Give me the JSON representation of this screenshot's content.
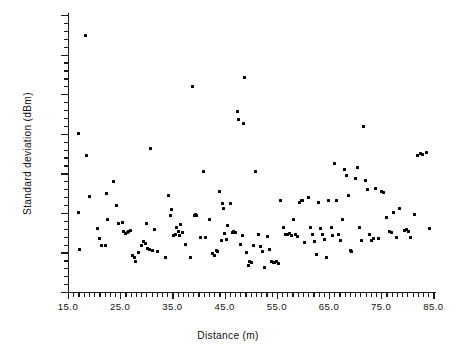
{
  "chart_data": {
    "type": "scatter",
    "title": "",
    "xlabel": "Distance (m)",
    "ylabel": "Standard deviation (dBm)",
    "xlim": [
      15.0,
      85.5
    ],
    "ylim": [
      0.0,
      7.0
    ],
    "grid": false,
    "legend": null,
    "marker": "square",
    "marker_color": "#000000",
    "x_major_ticks": [
      15.0,
      25.0,
      35.0,
      45.0,
      55.0,
      65.0,
      75.0,
      85.0
    ],
    "x_major_tick_labels": [
      "15.0",
      "25.0",
      "35.0",
      "45.0",
      "55.0",
      "65.0",
      "75.0",
      "85.0"
    ],
    "x_minor_tick_interval": 1.0,
    "y_major_ticks": [
      0.0,
      1.0,
      2.0,
      3.0,
      4.0,
      5.0,
      6.0,
      7.0
    ],
    "y_major_tick_labels": [
      "0.0",
      "1.0",
      "2.0",
      "3.0",
      "4.0",
      "5.0",
      "6.0",
      "7.0"
    ],
    "y_minor_tick_interval": 0.2,
    "n_points": 158,
    "points": [
      [
        17.0,
        4.0
      ],
      [
        17.0,
        2.0
      ],
      [
        17.2,
        1.08
      ],
      [
        18.4,
        6.47
      ],
      [
        18.6,
        3.45
      ],
      [
        19.2,
        2.42
      ],
      [
        20.6,
        1.6
      ],
      [
        21.0,
        1.35
      ],
      [
        21.4,
        1.18
      ],
      [
        22.2,
        1.18
      ],
      [
        22.4,
        2.48
      ],
      [
        22.6,
        1.82
      ],
      [
        23.8,
        2.8
      ],
      [
        24.2,
        2.18
      ],
      [
        24.6,
        1.72
      ],
      [
        25.4,
        1.75
      ],
      [
        25.6,
        1.52
      ],
      [
        26.0,
        1.47
      ],
      [
        26.4,
        1.5
      ],
      [
        26.6,
        1.52
      ],
      [
        27.0,
        1.55
      ],
      [
        27.4,
        0.93
      ],
      [
        27.8,
        0.88
      ],
      [
        28.0,
        0.76
      ],
      [
        28.6,
        1.0
      ],
      [
        29.0,
        1.18
      ],
      [
        29.4,
        1.27
      ],
      [
        29.8,
        1.22
      ],
      [
        30.0,
        1.72
      ],
      [
        30.2,
        1.1
      ],
      [
        30.6,
        1.08
      ],
      [
        30.8,
        3.63
      ],
      [
        31.2,
        1.05
      ],
      [
        31.6,
        1.57
      ],
      [
        32.2,
        1.02
      ],
      [
        33.6,
        0.88
      ],
      [
        34.2,
        2.43
      ],
      [
        34.6,
        1.94
      ],
      [
        34.8,
        2.08
      ],
      [
        35.2,
        1.43
      ],
      [
        35.6,
        1.45
      ],
      [
        35.8,
        1.62
      ],
      [
        36.2,
        1.52
      ],
      [
        36.4,
        1.43
      ],
      [
        36.6,
        1.7
      ],
      [
        37.0,
        1.5
      ],
      [
        37.6,
        1.2
      ],
      [
        38.4,
        0.86
      ],
      [
        38.8,
        5.2
      ],
      [
        39.2,
        1.93
      ],
      [
        39.4,
        1.96
      ],
      [
        39.6,
        1.94
      ],
      [
        40.4,
        1.37
      ],
      [
        41.0,
        3.04
      ],
      [
        41.4,
        1.38
      ],
      [
        42.2,
        1.83
      ],
      [
        42.6,
        0.98
      ],
      [
        43.0,
        0.93
      ],
      [
        43.4,
        1.05
      ],
      [
        43.6,
        1.02
      ],
      [
        44.0,
        2.53
      ],
      [
        44.4,
        1.29
      ],
      [
        44.6,
        2.23
      ],
      [
        44.8,
        2.12
      ],
      [
        45.0,
        1.47
      ],
      [
        45.4,
        1.33
      ],
      [
        45.6,
        1.68
      ],
      [
        46.2,
        2.23
      ],
      [
        46.6,
        1.5
      ],
      [
        46.8,
        1.53
      ],
      [
        47.0,
        1.5
      ],
      [
        47.4,
        4.55
      ],
      [
        47.6,
        4.35
      ],
      [
        48.0,
        1.2
      ],
      [
        48.4,
        1.44
      ],
      [
        48.6,
        4.26
      ],
      [
        48.8,
        5.42
      ],
      [
        49.2,
        1.0
      ],
      [
        49.6,
        0.66
      ],
      [
        49.8,
        0.78
      ],
      [
        50.2,
        0.74
      ],
      [
        50.6,
        1.18
      ],
      [
        51.0,
        3.05
      ],
      [
        51.4,
        1.46
      ],
      [
        51.8,
        1.16
      ],
      [
        52.2,
        1.02
      ],
      [
        52.6,
        0.62
      ],
      [
        53.2,
        1.41
      ],
      [
        53.6,
        1.08
      ],
      [
        54.0,
        0.78
      ],
      [
        54.4,
        0.75
      ],
      [
        54.6,
        0.74
      ],
      [
        55.0,
        0.76
      ],
      [
        55.4,
        0.73
      ],
      [
        55.8,
        2.3
      ],
      [
        56.2,
        1.63
      ],
      [
        56.6,
        1.45
      ],
      [
        56.8,
        1.46
      ],
      [
        57.0,
        1.45
      ],
      [
        57.4,
        1.48
      ],
      [
        57.8,
        1.43
      ],
      [
        58.2,
        1.82
      ],
      [
        58.6,
        1.45
      ],
      [
        59.0,
        1.4
      ],
      [
        59.4,
        2.27
      ],
      [
        59.8,
        2.32
      ],
      [
        60.0,
        2.3
      ],
      [
        60.4,
        1.25
      ],
      [
        61.0,
        2.38
      ],
      [
        61.4,
        1.62
      ],
      [
        61.8,
        1.45
      ],
      [
        62.2,
        1.27
      ],
      [
        62.6,
        0.95
      ],
      [
        63.0,
        2.27
      ],
      [
        63.4,
        1.6
      ],
      [
        63.8,
        1.45
      ],
      [
        64.2,
        1.32
      ],
      [
        64.6,
        0.86
      ],
      [
        65.0,
        2.3
      ],
      [
        65.4,
        1.63
      ],
      [
        65.6,
        1.44
      ],
      [
        66.0,
        3.25
      ],
      [
        66.4,
        2.32
      ],
      [
        66.8,
        1.46
      ],
      [
        67.2,
        1.3
      ],
      [
        67.6,
        1.82
      ],
      [
        68.0,
        3.1
      ],
      [
        68.4,
        2.95
      ],
      [
        68.8,
        2.45
      ],
      [
        69.2,
        1.05
      ],
      [
        69.4,
        1.02
      ],
      [
        70.0,
        2.86
      ],
      [
        70.4,
        3.14
      ],
      [
        70.8,
        1.62
      ],
      [
        71.2,
        1.3
      ],
      [
        71.6,
        4.18
      ],
      [
        72.0,
        2.82
      ],
      [
        72.4,
        2.58
      ],
      [
        72.8,
        1.45
      ],
      [
        73.2,
        1.3
      ],
      [
        73.6,
        1.36
      ],
      [
        74.0,
        2.62
      ],
      [
        74.4,
        1.35
      ],
      [
        75.0,
        2.55
      ],
      [
        75.4,
        2.52
      ],
      [
        76.0,
        1.88
      ],
      [
        76.6,
        1.52
      ],
      [
        77.0,
        1.5
      ],
      [
        77.4,
        2.0
      ],
      [
        78.0,
        1.38
      ],
      [
        78.6,
        2.1
      ],
      [
        79.4,
        1.55
      ],
      [
        79.8,
        1.58
      ],
      [
        80.2,
        1.54
      ],
      [
        80.6,
        1.38
      ],
      [
        81.4,
        1.95
      ],
      [
        82.0,
        3.45
      ],
      [
        82.6,
        3.5
      ],
      [
        83.0,
        3.47
      ],
      [
        83.6,
        3.52
      ],
      [
        84.2,
        1.6
      ]
    ]
  }
}
